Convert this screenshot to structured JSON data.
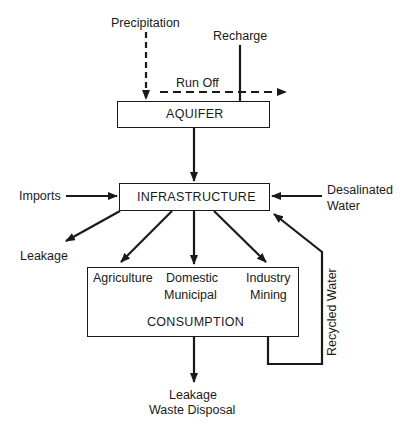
{
  "diagram": {
    "type": "water-resource-flow",
    "nodes": {
      "aquifer": {
        "label": "AQUIFER"
      },
      "infrastructure": {
        "label": "INFRASTRUCTURE"
      },
      "consumption": {
        "label": "CONSUMPTION",
        "sectors": [
          {
            "line1": "Agriculture",
            "line2": ""
          },
          {
            "line1": "Domestic",
            "line2": "Municipal"
          },
          {
            "line1": "Industry",
            "line2": "Mining"
          }
        ]
      }
    },
    "inputs": {
      "precipitation": "Precipitation",
      "recharge": "Recharge",
      "imports": "Imports",
      "desalinated_line1": "Desalinated",
      "desalinated_line2": "Water"
    },
    "outputs": {
      "run_off": "Run Off",
      "leakage": "Leakage",
      "final_line1": "Leakage",
      "final_line2": "Waste Disposal"
    },
    "loops": {
      "recycled": "Recycled Water"
    },
    "edges": [
      {
        "from": "Precipitation",
        "to": "AQUIFER",
        "style": "dashed"
      },
      {
        "from": "Precipitation",
        "to": "Run Off",
        "style": "dashed"
      },
      {
        "from": "Recharge",
        "to": "AQUIFER",
        "style": "solid"
      },
      {
        "from": "AQUIFER",
        "to": "INFRASTRUCTURE",
        "style": "solid"
      },
      {
        "from": "Imports",
        "to": "INFRASTRUCTURE",
        "style": "solid"
      },
      {
        "from": "Desalinated Water",
        "to": "INFRASTRUCTURE",
        "style": "solid"
      },
      {
        "from": "INFRASTRUCTURE",
        "to": "Leakage",
        "style": "solid"
      },
      {
        "from": "INFRASTRUCTURE",
        "to": "Agriculture",
        "style": "solid"
      },
      {
        "from": "INFRASTRUCTURE",
        "to": "Domestic Municipal",
        "style": "solid"
      },
      {
        "from": "INFRASTRUCTURE",
        "to": "Industry Mining",
        "style": "solid"
      },
      {
        "from": "CONSUMPTION",
        "to": "Leakage Waste Disposal",
        "style": "solid"
      },
      {
        "from": "CONSUMPTION",
        "to": "INFRASTRUCTURE",
        "label": "Recycled Water",
        "style": "solid"
      }
    ]
  }
}
